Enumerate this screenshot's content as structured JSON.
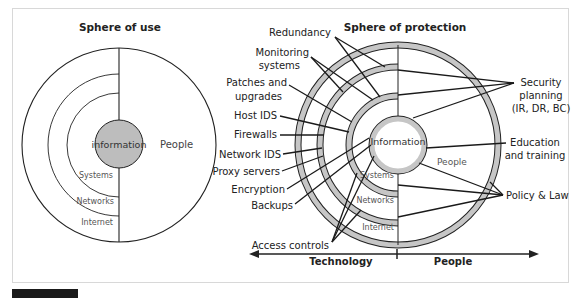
{
  "left_diagram": {
    "title": "Sphere of use",
    "center": "information",
    "people": "People",
    "layers": [
      "Systems",
      "Networks",
      "Internet"
    ],
    "colors": {
      "info_fill": "#bdbdbd",
      "stroke": "#222222"
    }
  },
  "right_diagram": {
    "title": "Sphere of protection",
    "center": "Information",
    "people": "People",
    "layers": [
      "Systems",
      "Networks",
      "Internet"
    ],
    "left_labels": [
      {
        "text": "Redundancy"
      },
      {
        "text": "Monitoring",
        "text2": "systems"
      },
      {
        "text": "Patches and",
        "text2": "upgrades"
      },
      {
        "text": "Host IDS"
      },
      {
        "text": "Firewalls"
      },
      {
        "text": "Network IDS"
      },
      {
        "text": "Proxy servers"
      },
      {
        "text": "Encryption"
      },
      {
        "text": "Backups"
      },
      {
        "text": "Access controls"
      }
    ],
    "right_labels": [
      {
        "text": "Security",
        "text2": "planning",
        "text3": "(IR, DR, BC)"
      },
      {
        "text": "Education",
        "text2": "and training"
      },
      {
        "text": "Policy & Law"
      }
    ],
    "axis": {
      "left": "Technology",
      "right": "People"
    },
    "colors": {
      "ring_fill": "#c6c6c6",
      "stroke": "#222222"
    }
  }
}
